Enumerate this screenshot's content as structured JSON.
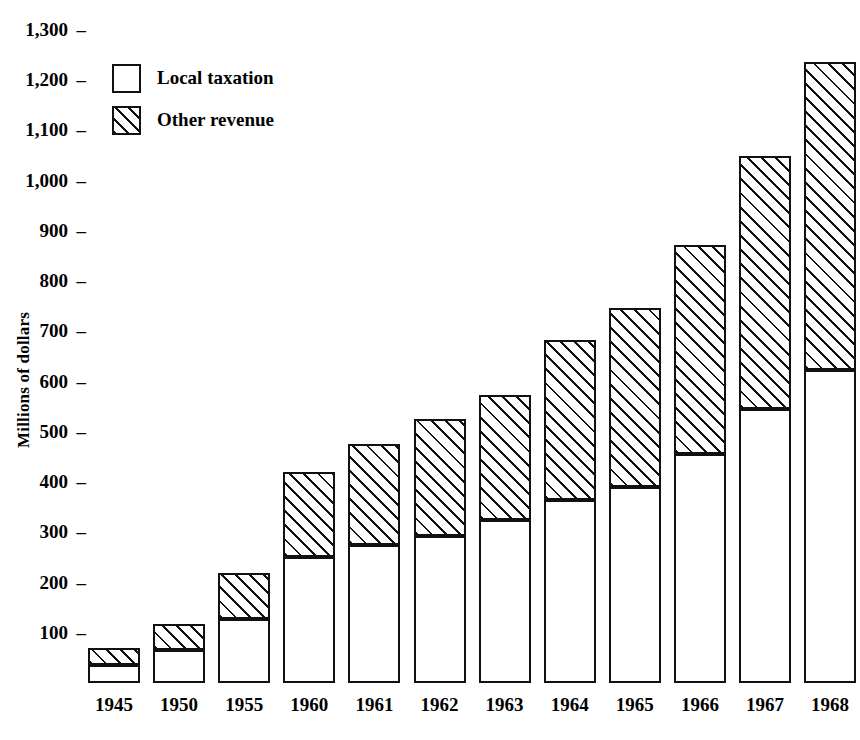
{
  "chart_data": {
    "type": "bar",
    "subtype": "stacked-bar",
    "title": "",
    "xlabel": "",
    "ylabel": "Millions of dollars",
    "categories": [
      "1945",
      "1950",
      "1955",
      "1960",
      "1961",
      "1962",
      "1963",
      "1964",
      "1965",
      "1966",
      "1967",
      "1968"
    ],
    "series": [
      {
        "name": "Local taxation",
        "values": [
          36,
          66,
          128,
          250,
          275,
          292,
          325,
          365,
          390,
          455,
          545,
          623
        ]
      },
      {
        "name": "Other revenue",
        "values": [
          34,
          52,
          90,
          170,
          200,
          233,
          248,
          318,
          357,
          417,
          503,
          613
        ]
      }
    ],
    "totals": [
      70,
      118,
      218,
      420,
      475,
      525,
      573,
      683,
      747,
      872,
      1048,
      1236
    ],
    "ylim": [
      0,
      1300
    ],
    "yticks": [
      "100",
      "200",
      "300",
      "400",
      "500",
      "600",
      "700",
      "800",
      "900",
      "1,000",
      "1,100",
      "1,200",
      "1,300"
    ],
    "ytick_values": [
      100,
      200,
      300,
      400,
      500,
      600,
      700,
      800,
      900,
      1000,
      1100,
      1200,
      1300
    ],
    "grid": false,
    "legend_position": "top-left",
    "legend": [
      {
        "label": "Local taxation",
        "swatch": "white"
      },
      {
        "label": "Other revenue",
        "swatch": "hatched"
      }
    ],
    "colors": {
      "line": "#111111",
      "local_taxation_fill": "#ffffff",
      "other_revenue_fill": "#ffffff",
      "background": "#ffffff"
    }
  }
}
